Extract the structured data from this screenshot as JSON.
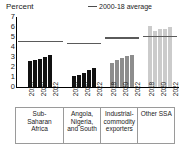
{
  "chart_data": {
    "type": "bar",
    "title": "",
    "subtitle": "",
    "ylabel": "Percent",
    "xlabel": "",
    "ylim": [
      0,
      7
    ],
    "yticks": [
      0,
      1,
      2,
      3,
      4,
      5,
      6,
      7
    ],
    "ytick_labels": [
      "0",
      "1",
      "2",
      "3",
      "4",
      "5",
      "6",
      "7"
    ],
    "grid": false,
    "legend_position": "top-right",
    "legend": [
      {
        "label": "2000-18 average",
        "marker": "line",
        "color": "#5a5a5a"
      }
    ],
    "x": [
      "2018",
      "2019",
      "2020",
      "2021",
      "2022"
    ],
    "xtick_labels_shown": [
      "2018",
      "",
      "2020",
      "",
      "2022"
    ],
    "groups": [
      {
        "name": "Sub-Saharan Africa",
        "label_lines": [
          "Sub-",
          "Saharan",
          "Africa"
        ],
        "bar_color": "#111111",
        "values": [
          2.6,
          2.7,
          2.8,
          3.0,
          3.2
        ],
        "average_2000_18": 4.5
      },
      {
        "name": "Angola, Nigeria, and South",
        "label_lines": [
          "Angola,",
          "Nigeria,",
          "and South"
        ],
        "bar_color": "#111111",
        "values": [
          1.1,
          1.2,
          1.4,
          1.7,
          1.9
        ],
        "average_2000_18": 4.3
      },
      {
        "name": "Industrial-commodity exporters",
        "label_lines": [
          "Industrial-",
          "commodity",
          "exporters"
        ],
        "bar_color": "#8d8d8d",
        "values": [
          2.4,
          2.7,
          2.9,
          3.1,
          3.2
        ],
        "average_2000_18": 4.85
      },
      {
        "name": "Other SSA",
        "label_lines": [
          "Other SSA"
        ],
        "bar_color": "#cbcbcb",
        "values": [
          6.1,
          5.6,
          5.8,
          5.8,
          6.0
        ],
        "average_2000_18": 5.0
      }
    ]
  },
  "header": {
    "unit_label": "Percent",
    "legend_label": "2000-18 average"
  }
}
